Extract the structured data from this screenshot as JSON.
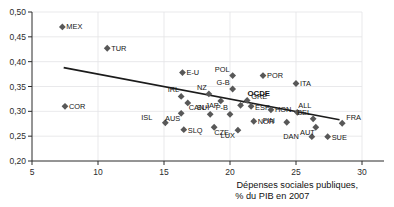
{
  "chart_data": {
    "type": "scatter",
    "title": "",
    "xlabel": "Dépenses sociales publiques, % du PIB en 2007",
    "ylabel": "",
    "xlim": [
      5,
      30
    ],
    "ylim": [
      0.2,
      0.5
    ],
    "xticks": [
      5,
      10,
      15,
      20,
      25,
      30
    ],
    "xtick_labels": [
      "5",
      "10",
      "15",
      "20",
      "25",
      "30"
    ],
    "yticks": [
      0.2,
      0.25,
      0.3,
      0.35,
      0.4,
      0.45,
      0.5
    ],
    "ytick_labels": [
      "0,20",
      "0,25",
      "0,30",
      "0,35",
      "0,40",
      "0,45",
      "0,50"
    ],
    "grid": true,
    "legend": "none",
    "points": [
      {
        "label": "MEX",
        "x": 7.3,
        "y": 0.47,
        "lx": 4,
        "ly": 2.5,
        "bold": false
      },
      {
        "label": "COR",
        "x": 7.5,
        "y": 0.31,
        "lx": 4,
        "ly": 2.5,
        "bold": false
      },
      {
        "label": "TUR",
        "x": 10.7,
        "y": 0.427,
        "lx": 4,
        "ly": 2.5,
        "bold": false
      },
      {
        "label": "ISL",
        "x": 15.1,
        "y": 0.277,
        "lx": -13,
        "ly": -3,
        "bold": false
      },
      {
        "label": "E-U",
        "x": 16.4,
        "y": 0.378,
        "lx": 4,
        "ly": 2.5,
        "bold": false
      },
      {
        "label": "IRL",
        "x": 16.3,
        "y": 0.33,
        "lx": -2,
        "ly": -4,
        "bold": false
      },
      {
        "label": "AUS",
        "x": 16.3,
        "y": 0.296,
        "lx": -1,
        "ly": 7.5,
        "bold": false
      },
      {
        "label": "SLQ",
        "x": 16.5,
        "y": 0.263,
        "lx": 4,
        "ly": 3,
        "bold": false
      },
      {
        "label": "CAN",
        "x": 16.8,
        "y": 0.317,
        "lx": 1,
        "ly": 7,
        "bold": false
      },
      {
        "label": "NZ",
        "x": 18.4,
        "y": 0.335,
        "lx": -2,
        "ly": -4,
        "bold": false
      },
      {
        "label": "SUI",
        "x": 18.5,
        "y": 0.294,
        "lx": -1,
        "ly": -4,
        "bold": false
      },
      {
        "label": "CZE",
        "x": 18.8,
        "y": 0.268,
        "lx": 0,
        "ly": 8,
        "bold": false
      },
      {
        "label": "JAP",
        "x": 19.3,
        "y": 0.321,
        "lx": -2,
        "ly": 7,
        "bold": false
      },
      {
        "label": "P-B",
        "x": 20.0,
        "y": 0.294,
        "lx": -2,
        "ly": -4,
        "bold": false
      },
      {
        "label": "G-B",
        "x": 20.2,
        "y": 0.345,
        "lx": -3,
        "ly": -4,
        "bold": false
      },
      {
        "label": "POL",
        "x": 20.2,
        "y": 0.372,
        "lx": -3,
        "ly": -4,
        "bold": false
      },
      {
        "label": "LUX",
        "x": 20.6,
        "y": 0.262,
        "lx": -3,
        "ly": 8,
        "bold": false
      },
      {
        "label": "OCDE",
        "x": 20.8,
        "y": 0.312,
        "lx": 7,
        "ly": -9,
        "bold": true
      },
      {
        "label": "GRE",
        "x": 21.3,
        "y": 0.322,
        "lx": 4,
        "ly": -1,
        "bold": false
      },
      {
        "label": "POR",
        "x": 22.5,
        "y": 0.372,
        "lx": 4,
        "ly": 2.5,
        "bold": false
      },
      {
        "label": "ESP",
        "x": 21.6,
        "y": 0.31,
        "lx": 4,
        "ly": 3.5,
        "bold": false
      },
      {
        "label": "NOR",
        "x": 21.8,
        "y": 0.28,
        "lx": 4,
        "ly": 2.5,
        "bold": false
      },
      {
        "label": "HON",
        "x": 23.1,
        "y": 0.303,
        "lx": 4,
        "ly": 2,
        "bold": false
      },
      {
        "label": "FIN",
        "x": 24.3,
        "y": 0.278,
        "lx": -12,
        "ly": 1,
        "bold": false
      },
      {
        "label": "ITA",
        "x": 25.0,
        "y": 0.356,
        "lx": 4,
        "ly": 2.5,
        "bold": false
      },
      {
        "label": "ALL",
        "x": 25.1,
        "y": 0.298,
        "lx": 1,
        "ly": -4,
        "bold": false
      },
      {
        "label": "BEL",
        "x": 26.3,
        "y": 0.285,
        "lx": -2,
        "ly": -4,
        "bold": false
      },
      {
        "label": "DAN",
        "x": 26.2,
        "y": 0.249,
        "lx": -13,
        "ly": 2.5,
        "bold": false
      },
      {
        "label": "AUT",
        "x": 26.5,
        "y": 0.268,
        "lx": -1,
        "ly": 8,
        "bold": false
      },
      {
        "label": "SUE",
        "x": 27.4,
        "y": 0.249,
        "lx": 4,
        "ly": 3.5,
        "bold": false
      },
      {
        "label": "FRA",
        "x": 28.5,
        "y": 0.276,
        "lx": 4,
        "ly": -3,
        "bold": false
      }
    ],
    "trendline": {
      "x0": 7.4,
      "y0": 0.388,
      "x1": 28.3,
      "y1": 0.283
    }
  },
  "axis": {
    "xtitle_line1": "Dépenses sociales publiques,",
    "xtitle_line2": "% du PIB en 2007"
  },
  "cut_text": {
    "top": "",
    "bottom": ""
  }
}
